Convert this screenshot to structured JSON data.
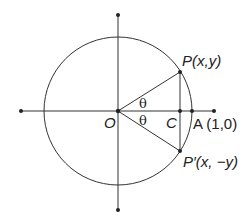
{
  "diagram": {
    "title": "",
    "colors": {
      "stroke": "#333333",
      "text": "#222222",
      "background": "#ffffff"
    },
    "geometry": {
      "origin": {
        "x": 118,
        "y": 111
      },
      "radius": 74,
      "x_axis": {
        "x1": 21,
        "x2": 214
      },
      "y_axis": {
        "y1": 15,
        "y2": 210
      },
      "P": {
        "x": 180,
        "y": 72
      },
      "P_prime": {
        "x": 180,
        "y": 151
      },
      "C": {
        "x": 180,
        "y": 111
      },
      "A": {
        "x": 192,
        "y": 111
      }
    },
    "labels": {
      "origin": "O",
      "point_c": "C",
      "point_a": "A (1,0)",
      "point_p": "P(x,y)",
      "point_p_prime": "P′(x, −y)",
      "angle_upper": "θ",
      "angle_lower": "θ"
    }
  }
}
